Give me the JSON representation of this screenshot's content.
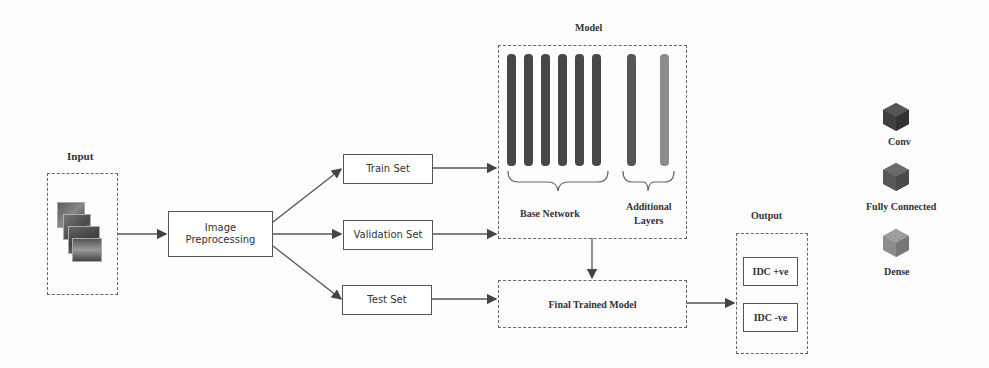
{
  "input": {
    "label": "Input"
  },
  "preprocessing": {
    "label_line1": "Image",
    "label_line2": "Preprocessing"
  },
  "splits": {
    "train": "Train Set",
    "validation": "Validation Set",
    "test": "Test Set"
  },
  "model": {
    "title": "Model",
    "base_network_label": "Base Network",
    "additional_label_line1": "Additional",
    "additional_label_line2": "Layers",
    "base_layer_count": 6,
    "colors": {
      "conv": "#4a4a4a",
      "fully_connected": "#555555",
      "dense": "#8a8a8a"
    }
  },
  "final_model": {
    "label": "Final Trained Model"
  },
  "output": {
    "title": "Output",
    "positive": "IDC +ve",
    "negative": "IDC -ve"
  },
  "legend": {
    "items": [
      {
        "label": "Conv",
        "color": "#3f3f3f"
      },
      {
        "label": "Fully Connected",
        "color": "#585858"
      },
      {
        "label": "Dense",
        "color": "#8c8c8c"
      }
    ]
  }
}
